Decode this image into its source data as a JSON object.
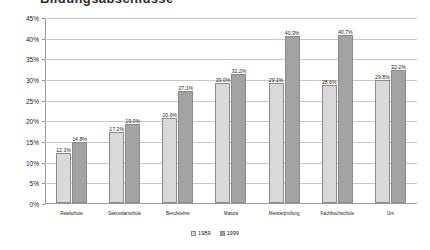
{
  "chart_data": {
    "type": "bar",
    "title": "Bildungsabschlüsse",
    "xlabel": "",
    "ylabel": "",
    "ylim": [
      0,
      45
    ],
    "ytick_labels": [
      "0%",
      "5%",
      "10%",
      "15%",
      "20%",
      "25%",
      "30%",
      "35%",
      "40%",
      "45%"
    ],
    "ytick_values": [
      0,
      5,
      10,
      15,
      20,
      25,
      30,
      35,
      40,
      45
    ],
    "grid": true,
    "legend_position": "bottom",
    "categories": [
      "Realschule",
      "Sekundarschule",
      "Berufslehre",
      "Matura",
      "Meisterprüfung",
      "Fachhochschule",
      "Uni"
    ],
    "series": [
      {
        "name": "1989",
        "color": "#d9d9d9",
        "values": [
          12.1,
          17.2,
          20.6,
          29.0,
          29.1,
          28.6,
          29.8
        ],
        "labels": [
          "12.1%",
          "17.2%",
          "20.6%",
          "29.0%",
          "29.1%",
          "28.6%",
          "29.8%"
        ]
      },
      {
        "name": "1999",
        "color": "#a3a3a3",
        "values": [
          14.8,
          19.0,
          27.1,
          31.2,
          40.3,
          40.7,
          32.2
        ],
        "labels": [
          "14.8%",
          "19.0%",
          "27.1%",
          "31.2%",
          "40.3%",
          "40.7%",
          "32.2%"
        ]
      }
    ]
  }
}
